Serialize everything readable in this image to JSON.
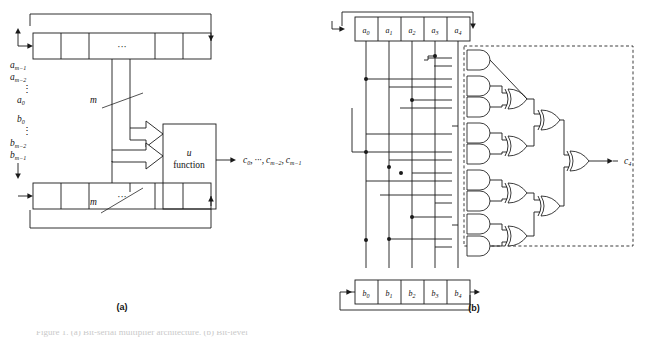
{
  "figure": {
    "panels": [
      {
        "id": "a",
        "caption": "(a)"
      },
      {
        "id": "b",
        "caption": "(b)"
      }
    ],
    "bottom_caption": "Figure 1. (a) Bit-serial multiplier architecture. (b) Bit-level"
  },
  "panel_a": {
    "inputs_a": [
      "a",
      "m-1"
    ],
    "input_labels": [
      {
        "base": "a",
        "sub": "m−1"
      },
      {
        "base": "a",
        "sub": "m−2"
      },
      {
        "base": "",
        "sub": ""
      },
      {
        "base": "a",
        "sub": "0"
      },
      {
        "base": "b",
        "sub": "0"
      },
      {
        "base": "",
        "sub": ""
      },
      {
        "base": "b",
        "sub": "m−2"
      },
      {
        "base": "b",
        "sub": "m−1"
      }
    ],
    "vdots": "⋮",
    "register_ellipsis": "···",
    "bus_width_label": "m",
    "function_block": {
      "line1": "u",
      "line2": "function"
    },
    "output_label": "c",
    "output_full": "c0, ···, cm−2, cm−1",
    "output_terms": [
      {
        "base": "c",
        "sub": "0"
      },
      {
        "base": "c",
        "sub": "m−2"
      },
      {
        "base": "c",
        "sub": "m−1"
      }
    ],
    "output_ellipsis": "···"
  },
  "panel_b": {
    "register_a_cells": [
      {
        "base": "a",
        "sub": "0"
      },
      {
        "base": "a",
        "sub": "1"
      },
      {
        "base": "a",
        "sub": "2"
      },
      {
        "base": "a",
        "sub": "3"
      },
      {
        "base": "a",
        "sub": "4"
      }
    ],
    "register_b_cells": [
      {
        "base": "b",
        "sub": "0"
      },
      {
        "base": "b",
        "sub": "1"
      },
      {
        "base": "b",
        "sub": "2"
      },
      {
        "base": "b",
        "sub": "3"
      },
      {
        "base": "b",
        "sub": "4"
      }
    ],
    "output": {
      "base": "c",
      "sub": "4"
    },
    "and_gate_count": 10,
    "xor_gate_count": 7,
    "dashed_boundary": true
  },
  "colors": {
    "background": "#ffffff",
    "ink": "#1a1a1a",
    "gate_fill": "#ffffff"
  }
}
